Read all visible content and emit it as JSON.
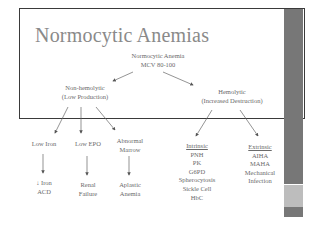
{
  "slide": {
    "title": "Normocytic Anemias",
    "root": {
      "line1": "Normocytic Anemia",
      "line2": "MCV 80-100"
    },
    "left_branch": {
      "line1": "Non-hemolytic",
      "line2": "(Low Production)"
    },
    "right_branch": {
      "line1": "Hemolytic",
      "line2": "(Increased Destruction)"
    },
    "low_production": [
      {
        "label": "Low Iron",
        "result_line1": "↓ Iron",
        "result_line2": "ACD"
      },
      {
        "label": "Low EPO",
        "result_line1": "Renal",
        "result_line2": "Failure"
      },
      {
        "label_line1": "Abnormal",
        "label_line2": "Marrow",
        "result_line1": "Aplastic",
        "result_line2": "Anemia"
      }
    ],
    "intrinsic": {
      "heading": "Intrinsic",
      "items": [
        "PNH",
        "PK",
        "G6PD",
        "Spherocytosis",
        "Sickle Cell",
        "HbC"
      ]
    },
    "extrinsic": {
      "heading": "Extrinsic",
      "items": [
        "AIHA",
        "MAHA",
        "Mechanical",
        "Infection"
      ]
    }
  },
  "colors": {
    "title": "#8a8a8a",
    "text": "#6a6a6a",
    "sidebar_dark": "#777777",
    "sidebar_light": "#bdbdbd",
    "frame": "#3a3a3a"
  }
}
